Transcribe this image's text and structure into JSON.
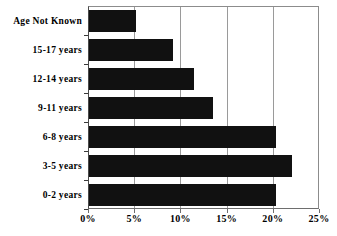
{
  "chart_data": {
    "type": "bar",
    "orientation": "horizontal",
    "title": "",
    "subtitle": "",
    "xlabel": "",
    "ylabel": "",
    "xlim": [
      0,
      25
    ],
    "xtick_labels": [
      "0%",
      "5%",
      "10%",
      "15%",
      "20%",
      "25%"
    ],
    "xticks": [
      0,
      5,
      10,
      15,
      20,
      25
    ],
    "grid": "vertical gridlines at 5%, 10%, 15%, 20%",
    "legend": "none",
    "bar_color": "#111111",
    "background_color": "#ffffff",
    "categories": [
      "Age Not Known",
      "15-17 years",
      "12-14 years",
      "9-11 years",
      "6-8 years",
      "3-5 years",
      "0-2 years"
    ],
    "values": [
      5.2,
      9.2,
      11.5,
      13.5,
      20.3,
      22.1,
      20.3
    ],
    "value_unit": "%"
  },
  "axis": {
    "x_unit_suffix": "%"
  }
}
